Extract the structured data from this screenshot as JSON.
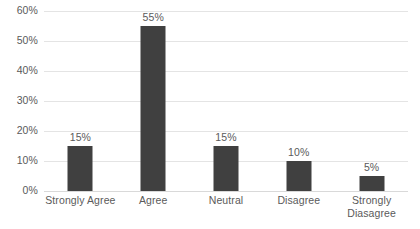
{
  "chart_data": {
    "type": "bar",
    "title": "",
    "subtitle": "",
    "xlabel": "",
    "ylabel": "",
    "categories": [
      "Strongly Agree",
      "Agree",
      "Neutral",
      "Disagree",
      "Strongly\nDiasagree"
    ],
    "values": [
      15,
      55,
      15,
      10,
      5
    ],
    "data_labels": [
      "15%",
      "55%",
      "15%",
      "10%",
      "5%"
    ],
    "ylim": [
      0,
      60
    ],
    "ytick_values": [
      0,
      10,
      20,
      30,
      40,
      50,
      60
    ],
    "ytick_labels": [
      "0%",
      "10%",
      "20%",
      "30%",
      "40%",
      "50%",
      "60%"
    ],
    "grid": true,
    "grid_axis": "y",
    "legend": false,
    "legend_position": "none",
    "series": [
      {
        "name": "Responses",
        "values": [
          15,
          55,
          15,
          10,
          5
        ]
      }
    ],
    "colors": {
      "bar": "#404040",
      "gridline": "#e4e4e4",
      "baseline": "#d9d9d9",
      "tick_label": "#5a5a5a",
      "data_label": "#5a5a5a",
      "background": "#ffffff"
    }
  }
}
